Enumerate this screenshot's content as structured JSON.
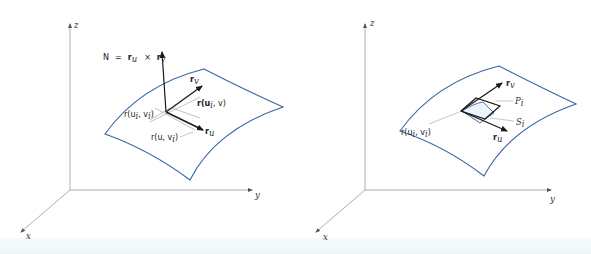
{
  "left_figure": {
    "axes": {
      "z": "z",
      "y": "y",
      "x": "x"
    },
    "normal_label": {
      "N": "N",
      "eq": "=",
      "r1": "r",
      "sub_u": "u",
      "cross": "×",
      "r2": "r",
      "sub_v": "v"
    },
    "rv_label": {
      "r": "r",
      "sub": "v"
    },
    "ru_label": {
      "r": "r",
      "sub": "u"
    },
    "curve_label_1": "r(u",
    "curve_label_1_sub": "i",
    "curve_label_1_tail": ", v)",
    "curve_label_2": "r(u",
    "curve_label_2_sub": "i",
    "curve_label_2_mid": ", v",
    "curve_label_2_sub2": "i",
    "curve_label_2_tail": ")",
    "curve_label_3": "r(u, v",
    "curve_label_3_sub": "i",
    "curve_label_3_tail": ")"
  },
  "right_figure": {
    "axes": {
      "z": "z",
      "y": "y",
      "x": "x"
    },
    "rv_label": {
      "r": "r",
      "sub": "v"
    },
    "ru_label": {
      "r": "r",
      "sub": "u"
    },
    "point_label": "r(u",
    "point_label_sub": "i",
    "point_label_mid": ", v",
    "point_label_sub2": "i",
    "point_label_tail": ")",
    "P_label": "P",
    "P_sub": "i",
    "S_label": "S",
    "S_sub": "i"
  },
  "colors": {
    "surface_edge": "#3a66a8",
    "axis": "#9a9a9a",
    "vector": "#1a1a1a",
    "tangent_line": "#b0b0b0"
  }
}
